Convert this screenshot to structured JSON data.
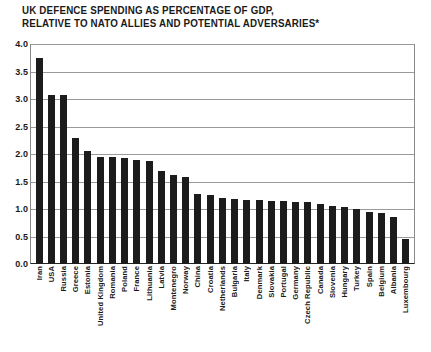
{
  "title": {
    "line1": "UK DEFENCE SPENDING AS PERCENTAGE OF GDP,",
    "line2": "RELATIVE TO NATO ALLIES AND POTENTIAL ADVERSARIES*"
  },
  "chart_data": {
    "type": "bar",
    "title": "UK DEFENCE SPENDING AS PERCENTAGE OF GDP, RELATIVE TO NATO ALLIES AND POTENTIAL ADVERSARIES*",
    "xlabel": "",
    "ylabel": "",
    "ylim": [
      0.0,
      4.0
    ],
    "ytick_labels": [
      "4.0",
      "3.5",
      "3.0",
      "2.5",
      "2.0",
      "1.5",
      "1.0",
      "0.5",
      "0.0"
    ],
    "yticks": [
      4.0,
      3.5,
      3.0,
      2.5,
      2.0,
      1.5,
      1.0,
      0.5,
      0.0
    ],
    "grid": true,
    "legend": "none",
    "bar_color": "#1c1c1c",
    "categories": [
      "Iran",
      "USA",
      "Russia",
      "Greece",
      "Estonia",
      "United Kingdom",
      "Romania",
      "Poland",
      "France",
      "Lithuania",
      "Latvia",
      "Montenegro",
      "Norway",
      "China",
      "Croatia",
      "Netherlands",
      "Bulgaria",
      "Italy",
      "Denmark",
      "Slovakia",
      "Portugal",
      "Germany",
      "Czech Republic",
      "Canada",
      "Slovenia",
      "Hungary",
      "Turkey",
      "Spain",
      "Belgium",
      "Albania",
      "Luxembourg"
    ],
    "values": [
      3.75,
      3.08,
      3.08,
      2.3,
      2.05,
      1.95,
      1.94,
      1.92,
      1.9,
      1.88,
      1.7,
      1.62,
      1.58,
      1.27,
      1.25,
      1.2,
      1.18,
      1.17,
      1.16,
      1.15,
      1.14,
      1.13,
      1.12,
      1.1,
      1.05,
      1.03,
      1.0,
      0.95,
      0.92,
      0.85,
      0.45
    ]
  }
}
